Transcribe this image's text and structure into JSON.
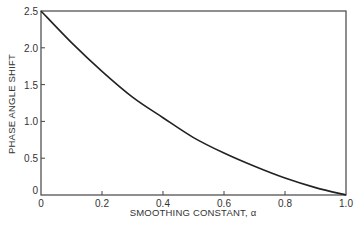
{
  "chart_data": {
    "type": "line",
    "title": "",
    "xlabel": "SMOOTHING CONSTANT, α",
    "ylabel": "PHASE ANGLE SHIFT",
    "xlim": [
      0,
      1.0
    ],
    "ylim": [
      0,
      2.5
    ],
    "x_ticks": [
      "0",
      "0.2",
      "0.4",
      "0.6",
      "0.8",
      "1.0"
    ],
    "y_ticks": [
      "0",
      "0.5",
      "1.0",
      "1.5",
      "2.0",
      "2.5"
    ],
    "grid": false,
    "legend": null,
    "series": [
      {
        "name": "phase angle shift",
        "x": [
          0,
          0.1,
          0.2,
          0.3,
          0.4,
          0.5,
          0.6,
          0.7,
          0.8,
          0.9,
          1.0
        ],
        "values": [
          2.5,
          2.07,
          1.68,
          1.33,
          1.05,
          0.78,
          0.57,
          0.39,
          0.23,
          0.1,
          0.0
        ]
      }
    ]
  },
  "colors": {
    "line": "#222222",
    "axis": "#444444",
    "background": "#ffffff"
  }
}
